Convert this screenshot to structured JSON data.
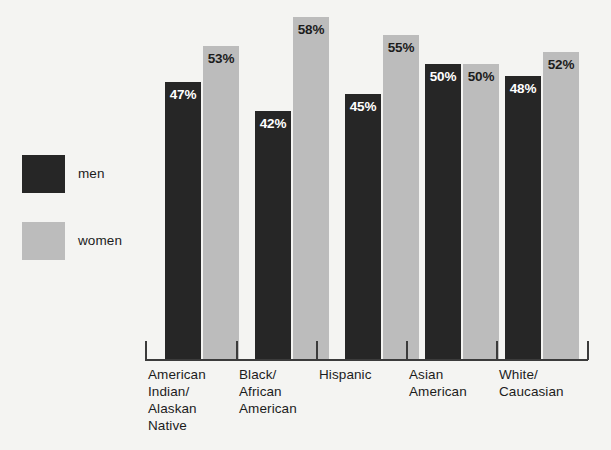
{
  "chart_data": {
    "type": "bar",
    "title": "",
    "subtitle": "",
    "xlabel": "",
    "ylabel": "",
    "ylim": [
      0,
      60
    ],
    "grid": false,
    "legend_position": "left",
    "value_suffix": "%",
    "categories": [
      "American\nIndian/\nAlaskan\nNative",
      "Black/\nAfrican\nAmerican",
      "Hispanic",
      "Asian\nAmerican",
      "White/\nCaucasian"
    ],
    "series": [
      {
        "name": "men",
        "color": "#262626",
        "values": [
          47,
          42,
          45,
          50,
          48
        ],
        "labels": [
          "47%",
          "42%",
          "45%",
          "50%",
          "48%"
        ]
      },
      {
        "name": "women",
        "color": "#bcbcbc",
        "values": [
          53,
          58,
          55,
          50,
          52
        ],
        "labels": [
          "53%",
          "58%",
          "55%",
          "50%",
          "52%"
        ]
      }
    ]
  },
  "legend": {
    "items": [
      {
        "label": "men",
        "color": "#262626",
        "swatch_name": "legend-swatch-men"
      },
      {
        "label": "women",
        "color": "#bcbcbc",
        "swatch_name": "legend-swatch-women"
      }
    ]
  },
  "axis": {
    "baseline_color": "#3b3b3b",
    "tick_count": 6
  },
  "colors": {
    "background": "#f4f4f2",
    "men": "#262626",
    "women": "#bcbcbc",
    "text": "#1c1c1c",
    "value_on_dark": "#ffffff",
    "value_on_light": "#1c1c1c",
    "axis": "#3b3b3b"
  }
}
